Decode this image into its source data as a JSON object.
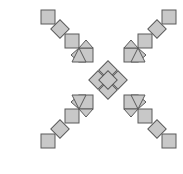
{
  "diagram": {
    "title": "",
    "colors": {
      "fill": "#c8c8c8",
      "stroke": "#5a5a5a",
      "background": "#ffffff"
    },
    "shapes": [
      {
        "type": "square",
        "arm": "center",
        "cx": 108,
        "cy": 70,
        "size": 13,
        "rotation": 45
      },
      {
        "type": "square",
        "arm": "center",
        "cx": 98,
        "cy": 80,
        "size": 13,
        "rotation": 45
      },
      {
        "type": "square",
        "arm": "center",
        "cx": 118,
        "cy": 80,
        "size": 13,
        "rotation": 45
      },
      {
        "type": "square",
        "arm": "center",
        "cx": 108,
        "cy": 90,
        "size": 13,
        "rotation": 45
      },
      {
        "type": "square",
        "arm": "center",
        "cx": 108,
        "cy": 80,
        "size": 13,
        "rotation": 45
      },
      {
        "type": "square",
        "arm": "top-left",
        "cx": 48,
        "cy": 17,
        "size": 14,
        "rotation": 0
      },
      {
        "type": "square",
        "arm": "top-left",
        "cx": 60,
        "cy": 29,
        "size": 13,
        "rotation": 45
      },
      {
        "type": "square",
        "arm": "top-left",
        "cx": 72,
        "cy": 41,
        "size": 14,
        "rotation": 0
      },
      {
        "type": "square",
        "arm": "top-left",
        "cx": 86,
        "cy": 55,
        "size": 14,
        "rotation": 0
      },
      {
        "type": "triangle",
        "arm": "top-left",
        "points": "79,48 93,48 86,40"
      },
      {
        "type": "triangle",
        "arm": "top-left",
        "points": "79,48 79,62 71,55"
      },
      {
        "type": "triangle",
        "arm": "top-left",
        "points": "79,48 72,62 86,62"
      },
      {
        "type": "square",
        "arm": "top-right",
        "cx": 169,
        "cy": 17,
        "size": 14,
        "rotation": 0
      },
      {
        "type": "square",
        "arm": "top-right",
        "cx": 157,
        "cy": 29,
        "size": 13,
        "rotation": 45
      },
      {
        "type": "square",
        "arm": "top-right",
        "cx": 145,
        "cy": 41,
        "size": 14,
        "rotation": 0
      },
      {
        "type": "square",
        "arm": "top-right",
        "cx": 131,
        "cy": 55,
        "size": 14,
        "rotation": 0
      },
      {
        "type": "triangle",
        "arm": "top-right",
        "points": "138,48 124,48 131,40"
      },
      {
        "type": "triangle",
        "arm": "top-right",
        "points": "138,48 138,62 146,55"
      },
      {
        "type": "triangle",
        "arm": "top-right",
        "points": "138,48 145,62 131,62"
      },
      {
        "type": "square",
        "arm": "bottom-left",
        "cx": 48,
        "cy": 141,
        "size": 14,
        "rotation": 0
      },
      {
        "type": "square",
        "arm": "bottom-left",
        "cx": 60,
        "cy": 129,
        "size": 13,
        "rotation": 45
      },
      {
        "type": "square",
        "arm": "bottom-left",
        "cx": 72,
        "cy": 116,
        "size": 14,
        "rotation": 0
      },
      {
        "type": "square",
        "arm": "bottom-left",
        "cx": 86,
        "cy": 102,
        "size": 14,
        "rotation": 0
      },
      {
        "type": "triangle",
        "arm": "bottom-left",
        "points": "79,109 93,109 86,117"
      },
      {
        "type": "triangle",
        "arm": "bottom-left",
        "points": "79,109 79,95 71,102"
      },
      {
        "type": "triangle",
        "arm": "bottom-left",
        "points": "79,109 72,95 86,95"
      },
      {
        "type": "square",
        "arm": "bottom-right",
        "cx": 169,
        "cy": 141,
        "size": 14,
        "rotation": 0
      },
      {
        "type": "square",
        "arm": "bottom-right",
        "cx": 157,
        "cy": 129,
        "size": 13,
        "rotation": 45
      },
      {
        "type": "square",
        "arm": "bottom-right",
        "cx": 145,
        "cy": 116,
        "size": 14,
        "rotation": 0
      },
      {
        "type": "square",
        "arm": "bottom-right",
        "cx": 131,
        "cy": 102,
        "size": 14,
        "rotation": 0
      },
      {
        "type": "triangle",
        "arm": "bottom-right",
        "points": "138,109 124,109 131,117"
      },
      {
        "type": "triangle",
        "arm": "bottom-right",
        "points": "138,109 138,95 146,102"
      },
      {
        "type": "triangle",
        "arm": "bottom-right",
        "points": "138,109 145,95 131,95"
      }
    ]
  }
}
